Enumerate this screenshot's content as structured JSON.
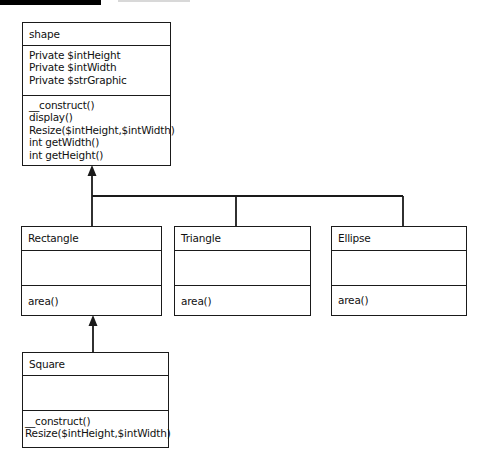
{
  "diagram": {
    "type": "uml-class-diagram",
    "classes": [
      {
        "name": "shape",
        "attributes": [
          "Private $intHeight",
          "Private $intWidth",
          "Private $strGraphic"
        ],
        "methods": [
          "__construct()",
          "display()",
          "Resize($intHeight,$intWidth)",
          "int getWidth()",
          "int getHeight()"
        ]
      },
      {
        "name": "Rectangle",
        "attributes": [],
        "methods": [
          "area()"
        ]
      },
      {
        "name": "Triangle",
        "attributes": [],
        "methods": [
          "area()"
        ]
      },
      {
        "name": "Ellipse",
        "attributes": [],
        "methods": [
          "area()"
        ]
      },
      {
        "name": "Square",
        "attributes": [],
        "methods": [
          "__construct()",
          "Resize($intHeight,$intWidth)"
        ]
      }
    ],
    "relationships": [
      {
        "from": "Rectangle",
        "to": "shape",
        "type": "inheritance"
      },
      {
        "from": "Triangle",
        "to": "shape",
        "type": "inheritance"
      },
      {
        "from": "Ellipse",
        "to": "shape",
        "type": "inheritance"
      },
      {
        "from": "Square",
        "to": "Rectangle",
        "type": "inheritance"
      }
    ],
    "colors": {
      "line": "#1a1a1a",
      "background": "#ffffff",
      "top_bar": "#000000"
    }
  }
}
